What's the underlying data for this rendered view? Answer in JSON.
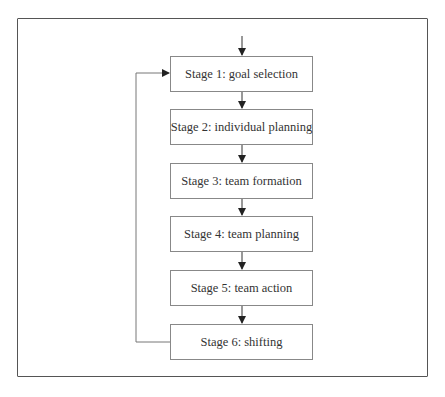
{
  "diagram": {
    "type": "flowchart",
    "stages": [
      {
        "label": "Stage 1: goal selection"
      },
      {
        "label": "Stage 2: individual planning"
      },
      {
        "label": "Stage 3: team formation"
      },
      {
        "label": "Stage 4: team planning"
      },
      {
        "label": "Stage 5: team action"
      },
      {
        "label": "Stage 6: shifting"
      }
    ],
    "edges": [
      {
        "from": "entry",
        "to": "Stage 1"
      },
      {
        "from": "Stage 1",
        "to": "Stage 2"
      },
      {
        "from": "Stage 2",
        "to": "Stage 3"
      },
      {
        "from": "Stage 3",
        "to": "Stage 4"
      },
      {
        "from": "Stage 4",
        "to": "Stage 5"
      },
      {
        "from": "Stage 5",
        "to": "Stage 6"
      },
      {
        "from": "Stage 6",
        "to": "Stage 1",
        "kind": "feedback-loop"
      }
    ]
  },
  "caption": ""
}
